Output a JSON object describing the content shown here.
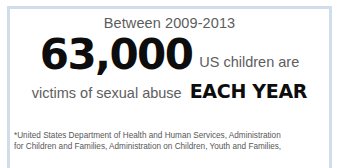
{
  "card": {
    "frame_color": "#cfdeea",
    "background": "#ffffff",
    "body_text_color": "#5d5d5d",
    "emphasis_text_color": "#0d0d0d"
  },
  "stat": {
    "period_label": "Between 2009-2013",
    "value": "63,000",
    "value_suffix": "US children are",
    "descriptor": "victims of sexual abuse",
    "frequency": "EACH YEAR"
  },
  "footnote": {
    "line1": "*United States Department of Health and Human Services, Administration",
    "line2": "for Children and Families, Administration on Children, Youth and Families,"
  }
}
